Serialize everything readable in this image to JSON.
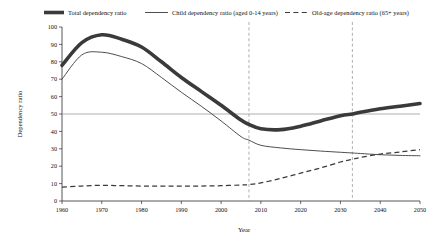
{
  "chart_data": {
    "type": "line",
    "title": "",
    "xlabel": "Year",
    "ylabel": "Dependency ratio",
    "xlim": [
      1960,
      2050
    ],
    "ylim": [
      0,
      100
    ],
    "grid": false,
    "legend_position": "top",
    "x_ticks": [
      "1960",
      "1970",
      "1980",
      "1990",
      "2000",
      "2010",
      "2020",
      "2030",
      "2040",
      "2050"
    ],
    "y_ticks": [
      "0",
      "10",
      "20",
      "30",
      "40",
      "50",
      "60",
      "70",
      "80",
      "90",
      "100"
    ],
    "reference_lines": {
      "horizontal": [
        50
      ],
      "vertical": [
        2007,
        2033
      ]
    },
    "x": [
      1960,
      1965,
      1970,
      1975,
      1980,
      1985,
      1990,
      1995,
      2000,
      2005,
      2007,
      2010,
      2015,
      2020,
      2025,
      2030,
      2033,
      2035,
      2040,
      2045,
      2050
    ],
    "series": [
      {
        "name": "Total dependency ratio",
        "style": "thick-solid",
        "values": [
          78,
          91,
          95.5,
          93,
          88.5,
          80,
          71,
          63,
          55,
          46.5,
          44,
          41.5,
          41,
          43,
          46,
          49,
          50,
          51,
          53,
          54.5,
          56
        ]
      },
      {
        "name": "Child dependency ratio (aged 0-14 years)",
        "style": "thin-solid",
        "values": [
          70,
          84,
          85.5,
          83,
          79,
          71,
          62.5,
          54.5,
          46,
          37,
          35,
          32,
          30.5,
          29.5,
          28.7,
          28,
          27.6,
          27.3,
          26.6,
          26.2,
          26
        ]
      },
      {
        "name": "Old-age dependency ratio (65+ years)",
        "style": "dashed",
        "values": [
          8,
          8.6,
          9,
          8.8,
          8.6,
          8.5,
          8.5,
          8.6,
          8.8,
          9.2,
          9.4,
          10.4,
          13,
          16,
          19,
          22.4,
          24,
          25,
          27,
          28.2,
          29.5
        ]
      }
    ]
  },
  "legend": {
    "items": [
      {
        "label": "Total dependency ratio"
      },
      {
        "label": "Child dependency ratio (aged 0-14 years)"
      },
      {
        "label": "Old-age dependency ratio (65+ years)"
      }
    ]
  }
}
